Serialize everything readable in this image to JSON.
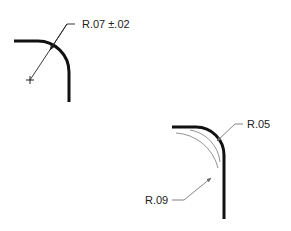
{
  "figure": {
    "colors": {
      "geometry": "#111111",
      "dimension": "#555555",
      "background": "#ffffff"
    },
    "example_1": {
      "label": "R.07 ±.02",
      "center_mark": "+"
    },
    "example_2": {
      "labels": {
        "max_radius": "R.05",
        "min_radius": "R.09"
      }
    }
  }
}
